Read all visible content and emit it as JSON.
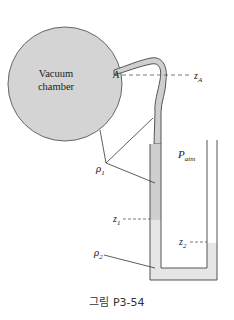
{
  "figure": {
    "chamber_label_line1": "Vacuum",
    "chamber_label_line2": "chamber",
    "point_A": "A",
    "z_A": "z",
    "z_A_sub": "A",
    "P_atm": "P",
    "P_atm_sub": "atm",
    "rho1": "ρ",
    "rho1_sub": "1",
    "rho2": "ρ",
    "rho2_sub": "2",
    "z1": "z",
    "z1_sub": "1",
    "z2": "z",
    "z2_sub": "2",
    "caption": "그림 P3-54"
  },
  "colors": {
    "chamber_fill": "#d4d4d4",
    "fluid1_fill": "#cfcfcf",
    "fluid2_fill": "#e6e6e6",
    "stroke": "#555555"
  }
}
